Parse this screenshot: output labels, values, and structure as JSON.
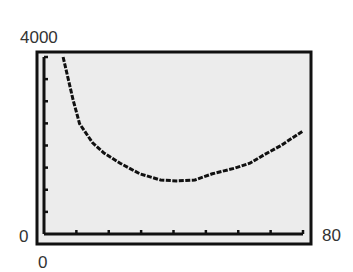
{
  "chart_data": {
    "type": "line",
    "title": "",
    "xlabel": "",
    "ylabel": "",
    "xlim": [
      0,
      80
    ],
    "ylim": [
      0,
      4000
    ],
    "x_tick_step": 10,
    "y_tick_step": 500,
    "grid": false,
    "legend": null,
    "style": "graphing-calculator",
    "window_labels": {
      "ymax": "4000",
      "ymin": "0",
      "xmin": "0",
      "xmax": "80"
    },
    "series": [
      {
        "name": "curve",
        "x": [
          5.9,
          9,
          11,
          15,
          18.5,
          23.5,
          29.6,
          36,
          41,
          46.6,
          52,
          59,
          63.6,
          68,
          73,
          80
        ],
        "y": [
          4000,
          3030,
          2490,
          2060,
          1830,
          1600,
          1360,
          1220,
          1200,
          1220,
          1360,
          1490,
          1600,
          1790,
          1990,
          2330
        ]
      }
    ]
  },
  "colors": {
    "background": "#ffffff",
    "screen": "#ebebeb",
    "frame": "#111111",
    "curve": "#111111"
  }
}
